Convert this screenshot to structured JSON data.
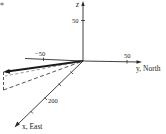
{
  "diagram": {
    "type": "3d-coordinate-axes-vector",
    "axes": {
      "z": {
        "label": "z",
        "tick_label": "50"
      },
      "y": {
        "label": "y, North",
        "tick_label_pos": "50",
        "tick_label_neg": "−50"
      },
      "x": {
        "label": "x, East",
        "tick_label": "200"
      }
    },
    "vector": {
      "style": "bold-arrow",
      "projection_style": "dashed"
    },
    "colors": {
      "line": "#2a2a2a",
      "background": "#ffffff"
    }
  }
}
